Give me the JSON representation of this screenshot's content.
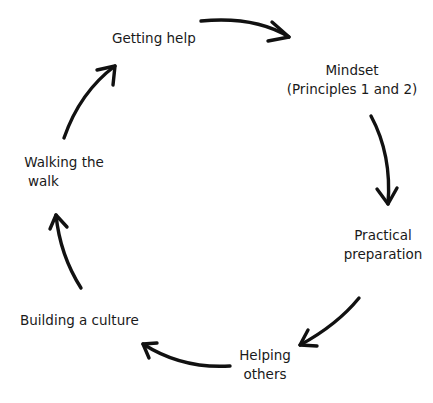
{
  "diagram": {
    "type": "cycle",
    "nodes": [
      {
        "id": "getting-help",
        "lines": [
          "Getting help"
        ]
      },
      {
        "id": "mindset",
        "lines": [
          "Mindset",
          "(Principles 1 and 2)"
        ]
      },
      {
        "id": "practical-preparation",
        "lines": [
          "Practical",
          "preparation"
        ]
      },
      {
        "id": "helping-others",
        "lines": [
          "Helping",
          "others"
        ]
      },
      {
        "id": "building-a-culture",
        "lines": [
          "Building a culture"
        ]
      },
      {
        "id": "walking-the-walk",
        "lines": [
          "Walking the",
          "walk"
        ]
      }
    ],
    "edges": [
      {
        "from": "getting-help",
        "to": "mindset"
      },
      {
        "from": "mindset",
        "to": "practical-preparation"
      },
      {
        "from": "practical-preparation",
        "to": "helping-others"
      },
      {
        "from": "helping-others",
        "to": "building-a-culture"
      },
      {
        "from": "building-a-culture",
        "to": "walking-the-walk"
      },
      {
        "from": "walking-the-walk",
        "to": "getting-help"
      }
    ]
  }
}
